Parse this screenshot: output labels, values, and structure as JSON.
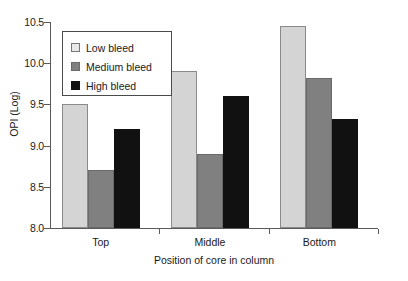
{
  "chart_data": {
    "type": "bar",
    "title": "",
    "xlabel": "Position of core in column",
    "ylabel": "OPI (Log)",
    "categories": [
      "Top",
      "Middle",
      "Bottom"
    ],
    "ylim": [
      8.0,
      10.5
    ],
    "yticks": [
      "8.0",
      "8.5",
      "9.0",
      "9.5",
      "10.0",
      "10.5"
    ],
    "ytick_values": [
      8.0,
      8.5,
      9.0,
      9.5,
      10.0,
      10.5
    ],
    "grid": false,
    "legend_position": "top-left",
    "series": [
      {
        "name": "Low bleed",
        "color": "#d4d4d4",
        "values": [
          9.5,
          9.9,
          10.45
        ]
      },
      {
        "name": "Medium bleed",
        "color": "#808080",
        "values": [
          8.7,
          8.9,
          9.82
        ]
      },
      {
        "name": "High bleed",
        "color": "#111111",
        "values": [
          9.2,
          9.6,
          9.32
        ]
      }
    ]
  }
}
